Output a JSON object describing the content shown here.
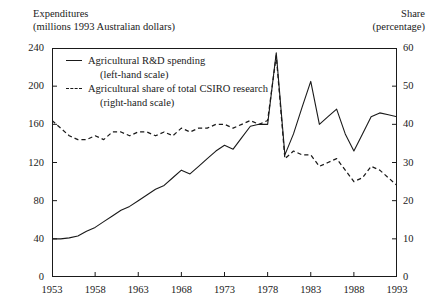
{
  "header": {
    "left_line1": "Expenditures",
    "left_line2": "(millions 1993 Australian dollars)",
    "right_line1": "Share",
    "right_line2": "(percentage)"
  },
  "legend": {
    "series1_label": "Agricultural R&D spending",
    "series1_scale": "(left-hand scale)",
    "series2_label": "Agricultural share of total CSIRO research",
    "series2_scale": "(right-hand scale)"
  },
  "axes": {
    "left_ticks": [
      "240",
      "200",
      "160",
      "120",
      "80",
      "40",
      "0"
    ],
    "right_ticks": [
      "60",
      "50",
      "40",
      "30",
      "20",
      "10",
      "0"
    ],
    "x_ticks": [
      "1953",
      "1958",
      "1963",
      "1968",
      "1973",
      "1978",
      "1983",
      "1988",
      "1993"
    ]
  },
  "chart_data": {
    "type": "line",
    "title": "",
    "subtitle": "",
    "xlabel": "",
    "ylabel": "Expenditures (millions 1993 Australian dollars)",
    "y2label": "Share (percentage)",
    "xlim": [
      1953,
      1993
    ],
    "ylim": [
      0,
      240
    ],
    "y2lim": [
      0,
      60
    ],
    "grid": false,
    "legend_position": "top-left-inside",
    "x": [
      1953,
      1954,
      1955,
      1956,
      1957,
      1958,
      1959,
      1960,
      1961,
      1962,
      1963,
      1964,
      1965,
      1966,
      1967,
      1968,
      1969,
      1970,
      1971,
      1972,
      1973,
      1974,
      1975,
      1976,
      1977,
      1978,
      1979,
      1980,
      1981,
      1982,
      1983,
      1984,
      1985,
      1986,
      1987,
      1988,
      1989,
      1990,
      1991,
      1992,
      1993
    ],
    "series": [
      {
        "name": "Agricultural R&D spending",
        "axis": "left",
        "style": "solid",
        "color": "#1a1a1a",
        "units": "millions 1993 Australian dollars",
        "values": [
          40,
          40,
          41,
          43,
          48,
          52,
          58,
          64,
          70,
          74,
          80,
          86,
          92,
          96,
          104,
          112,
          108,
          116,
          124,
          132,
          138,
          134,
          146,
          158,
          160,
          160,
          235,
          128,
          150,
          178,
          205,
          160,
          168,
          176,
          150,
          132,
          150,
          168,
          172,
          170,
          168
        ]
      },
      {
        "name": "Agricultural share of total CSIRO research",
        "axis": "right",
        "style": "dashed",
        "color": "#1a1a1a",
        "units": "percentage",
        "values": [
          41,
          39,
          37,
          36,
          36,
          37,
          36,
          38,
          38,
          37,
          38,
          38,
          37,
          38,
          37,
          39,
          38,
          39,
          39,
          40,
          40,
          39,
          40,
          41,
          40,
          41,
          58,
          31,
          33,
          32,
          32,
          29,
          30,
          31,
          28,
          25,
          26,
          29,
          28,
          26,
          24
        ]
      }
    ],
    "annotations": [
      {
        "text": "Sharp spike in both series at 1978",
        "x": 1978
      }
    ]
  }
}
